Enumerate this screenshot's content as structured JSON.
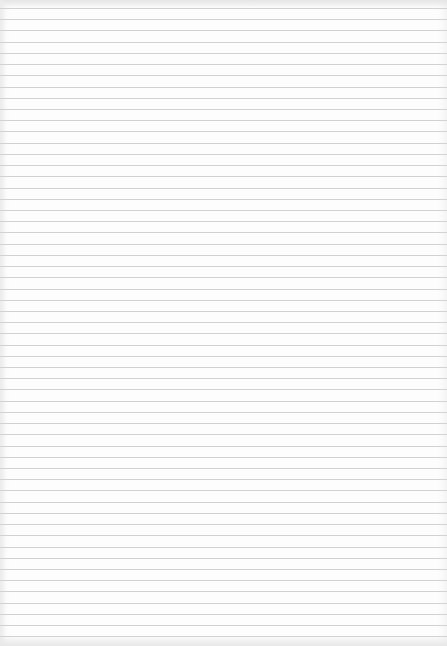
{
  "paper": {
    "kind": "blank ruled paper",
    "background_color": "#fdfdfd",
    "line_color": "#d2d2d2",
    "first_line_y": 8,
    "line_spacing": 11.22,
    "line_count": 57
  }
}
